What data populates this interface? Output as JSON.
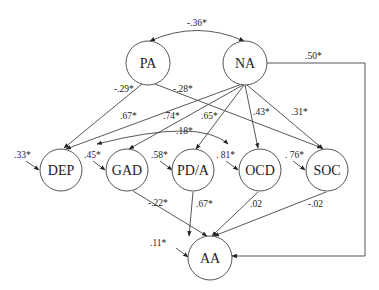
{
  "nodes": {
    "PA": {
      "label": "PA",
      "x": 148,
      "y": 63
    },
    "NA": {
      "label": "NA",
      "x": 245,
      "y": 63
    },
    "DEP": {
      "label": "DEP",
      "x": 61,
      "y": 170
    },
    "GAD": {
      "label": "GAD",
      "x": 127,
      "y": 170
    },
    "PDA": {
      "label": "PD/A",
      "x": 193,
      "y": 170
    },
    "OCD": {
      "label": "OCD",
      "x": 260,
      "y": 170
    },
    "SOC": {
      "label": "SOC",
      "x": 327,
      "y": 170
    },
    "AA": {
      "label": "AA",
      "x": 210,
      "y": 258
    }
  },
  "edges": {
    "pa_na_cov": "-.36*",
    "pa_dep": "-.29*",
    "pa_soc": "-.28*",
    "na_dep": ".67*",
    "na_gad": ".74*",
    "na_pda": ".65*",
    "na_ocd": ".43*",
    "na_soc": ".31*",
    "na_aa": ".50*",
    "gad_ocd_cov": ".18*",
    "gad_aa": "-.22*",
    "pda_aa": ".67*",
    "ocd_aa": ".02",
    "soc_aa": "-.02"
  },
  "residuals": {
    "dep": ".33*",
    "gad": ".45*",
    "pda": ".58*",
    "ocd": ". 81*",
    "soc": ". 76*",
    "aa": ".11*"
  }
}
